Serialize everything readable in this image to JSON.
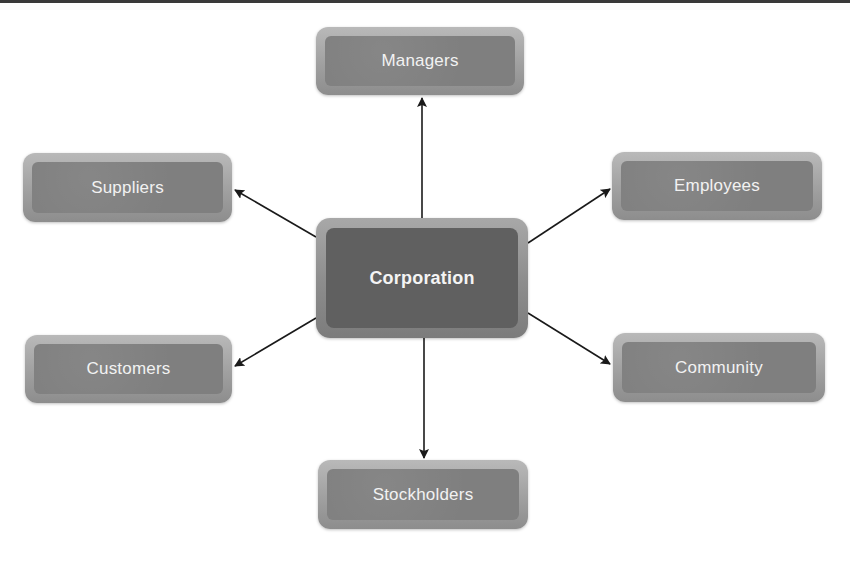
{
  "diagram": {
    "title": "",
    "center": {
      "id": "corporation",
      "label": "Corporation"
    },
    "stakeholders": [
      {
        "id": "managers",
        "label": "Managers",
        "position": "top"
      },
      {
        "id": "suppliers",
        "label": "Suppliers",
        "position": "upper-left"
      },
      {
        "id": "employees",
        "label": "Employees",
        "position": "upper-right"
      },
      {
        "id": "customers",
        "label": "Customers",
        "position": "lower-left"
      },
      {
        "id": "community",
        "label": "Community",
        "position": "lower-right"
      },
      {
        "id": "stockholders",
        "label": "Stockholders",
        "position": "bottom"
      }
    ],
    "edges": [
      {
        "from": "corporation",
        "to": "managers"
      },
      {
        "from": "corporation",
        "to": "suppliers"
      },
      {
        "from": "corporation",
        "to": "employees"
      },
      {
        "from": "corporation",
        "to": "customers"
      },
      {
        "from": "corporation",
        "to": "community"
      },
      {
        "from": "corporation",
        "to": "stockholders"
      }
    ],
    "colors": {
      "node_fill": "#7f7f7f",
      "node_bevel": "#a8a8a8",
      "center_fill": "#606060",
      "arrow": "#1a1a1a",
      "label": "#f2f2f2"
    }
  }
}
